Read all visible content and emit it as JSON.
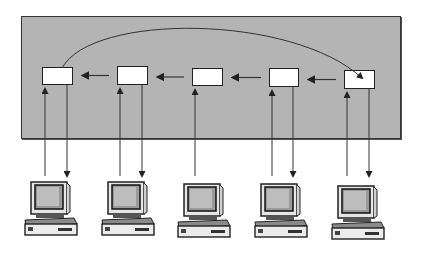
{
  "diagram": {
    "type": "ring-network-illustration",
    "panel_color": "#b4b4b4",
    "line_color": "#333333",
    "nodes": [
      {
        "id": "node-1",
        "x": 42,
        "y": 67,
        "w": 31,
        "h": 18
      },
      {
        "id": "node-2",
        "x": 117,
        "y": 66,
        "w": 31,
        "h": 19
      },
      {
        "id": "node-3",
        "x": 192,
        "y": 68,
        "w": 31,
        "h": 18
      },
      {
        "id": "node-4",
        "x": 269,
        "y": 68,
        "w": 30,
        "h": 19
      },
      {
        "id": "node-5",
        "x": 344,
        "y": 70,
        "w": 31,
        "h": 19
      }
    ],
    "computers": [
      {
        "id": "computer-1",
        "x": 22,
        "y": 180
      },
      {
        "id": "computer-2",
        "x": 99,
        "y": 180
      },
      {
        "id": "computer-3",
        "x": 175,
        "y": 182
      },
      {
        "id": "computer-4",
        "x": 252,
        "y": 182
      },
      {
        "id": "computer-5",
        "x": 329,
        "y": 184
      }
    ],
    "links": [
      {
        "from": "node-5",
        "to": "node-4",
        "direction": "left"
      },
      {
        "from": "node-4",
        "to": "node-3",
        "direction": "left"
      },
      {
        "from": "node-3",
        "to": "node-2",
        "direction": "left"
      },
      {
        "from": "node-2",
        "to": "node-1",
        "direction": "left"
      },
      {
        "from": "node-1",
        "to": "node-5",
        "direction": "arc-back"
      }
    ],
    "connections": [
      {
        "computer": "computer-1",
        "up": true,
        "down": true
      },
      {
        "computer": "computer-2",
        "up": true,
        "down": true
      },
      {
        "computer": "computer-3",
        "up": true,
        "down": false
      },
      {
        "computer": "computer-4",
        "up": true,
        "down": true
      },
      {
        "computer": "computer-5",
        "up": true,
        "down": true
      }
    ]
  }
}
